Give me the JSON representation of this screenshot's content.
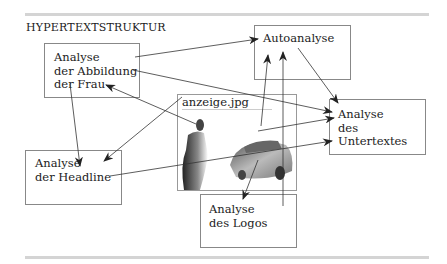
{
  "title": "HYPERTEXTSTRUKTUR",
  "nodes": {
    "frau": "Analyse\nder Abbildung\nder Frau",
    "auto": "Autoanalyse",
    "untertext": "Analyse\ndes\nUntertextes",
    "headline": "Analyse\nder Headline",
    "logos": "Analyse\ndes Logos"
  },
  "image": {
    "caption": "anzeige.jpg"
  },
  "colors": {
    "line": "#333333",
    "box_border": "#888888",
    "rule": "#d4d4d4"
  }
}
